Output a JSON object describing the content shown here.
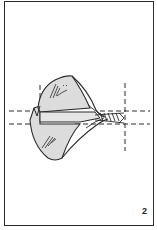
{
  "figure": {
    "number": "2",
    "colors": {
      "outline": "#2a2a2a",
      "fill": "#dcdcdc",
      "background": "#ffffff"
    }
  }
}
